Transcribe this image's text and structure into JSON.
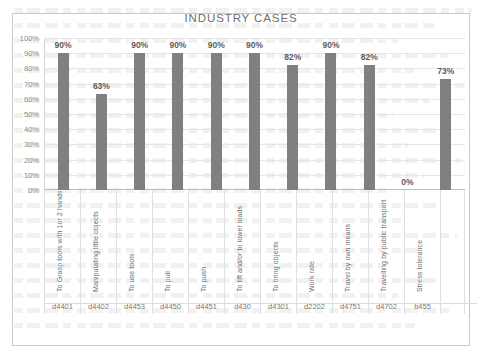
{
  "chart_data": {
    "type": "bar",
    "title": "INDUSTRY CASES",
    "xlabel": "",
    "ylabel": "",
    "ylim": [
      0,
      100
    ],
    "grid": true,
    "legend": "none",
    "value_suffix": "%",
    "ytick_labels": [
      "100%",
      "90%",
      "80%",
      "70%",
      "60%",
      "50%",
      "40%",
      "30%",
      "20%",
      "10%",
      "0%"
    ],
    "ytick_values": [
      100,
      90,
      80,
      70,
      60,
      50,
      40,
      30,
      20,
      10,
      0
    ],
    "categories": [
      "To Grasp tools with 1or 2 hands",
      "Manipulating little objects",
      "To use tools",
      "To pull",
      "To push",
      "To lift and/or to lower loads",
      "To bring objects",
      "Work rate",
      "Travel by own means",
      "Travelling by public transport",
      "Stress tolerance"
    ],
    "codes": [
      "d4401",
      "d4402",
      "d4453",
      "d4450",
      "d4451",
      "d430",
      "d4301",
      "d2202",
      "d4751",
      "d4702",
      "b455"
    ],
    "values": [
      90,
      63,
      90,
      90,
      90,
      90,
      82,
      90,
      82,
      0,
      73
    ],
    "data_labels": [
      "90%",
      "63%",
      "90%",
      "90%",
      "90%",
      "90%",
      "82%",
      "90%",
      "82%",
      "0%",
      "73%"
    ],
    "bar_color": "#808080",
    "title_color": "#6e6e6e",
    "gridline_color": "#e6e6e6"
  }
}
